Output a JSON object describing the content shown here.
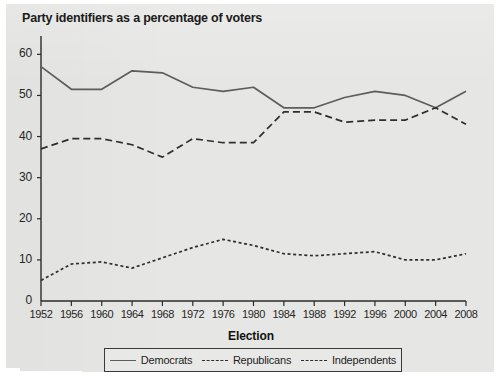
{
  "chart_data": {
    "type": "line",
    "title": "Party identifiers as a percentage of voters",
    "xlabel": "Election",
    "ylabel": "",
    "grid": false,
    "legend_position": "bottom",
    "ylim": [
      0,
      63
    ],
    "yticks": [
      0,
      10,
      20,
      30,
      40,
      50,
      60
    ],
    "categories": [
      "1952",
      "1956",
      "1960",
      "1964",
      "1968",
      "1972",
      "1976",
      "1980",
      "1984",
      "1988",
      "1992",
      "1996",
      "2000",
      "2004",
      "2008"
    ],
    "series": [
      {
        "name": "Democrats",
        "style": "solid",
        "color": "#5d5d5d",
        "values": [
          57,
          51.5,
          51.5,
          56,
          55.5,
          52,
          51,
          52,
          47,
          47,
          49.5,
          51,
          50,
          47,
          51
        ]
      },
      {
        "name": "Republicans",
        "style": "dashed",
        "color": "#2e2e2e",
        "values": [
          37,
          39.5,
          39.5,
          38,
          35,
          39.5,
          38.5,
          38.5,
          46,
          46,
          43.5,
          44,
          44,
          47,
          43
        ]
      },
      {
        "name": "Independents",
        "style": "dotted",
        "color": "#2e2e2e",
        "values": [
          5,
          9,
          9.5,
          8,
          10.5,
          13,
          15,
          13.5,
          11.5,
          11,
          11.5,
          12,
          10,
          10,
          11.5
        ]
      }
    ]
  },
  "legend": {
    "items": [
      {
        "label": "Democrats"
      },
      {
        "label": "Republicans"
      },
      {
        "label": "Independents"
      }
    ]
  }
}
